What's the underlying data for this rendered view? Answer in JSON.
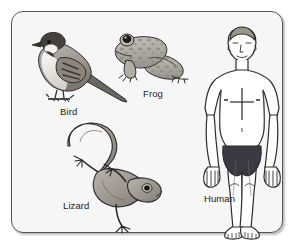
{
  "figure": {
    "background_color": "#ffffff",
    "panel_color": "#f6f6f6",
    "border_color": "#555555"
  },
  "specimens": [
    {
      "id": "bird",
      "label": "Bird",
      "description": "Side view of a perching sparrow facing left with long pointed tail",
      "colors": {
        "body": "#a8a39b",
        "head": "#4a4540",
        "cheek": "#f2f0ec",
        "wing": "#6e6962",
        "outline": "#2b2b2b"
      }
    },
    {
      "id": "frog",
      "label": "Frog",
      "description": "Side view of a sitting frog facing left with mottled spots and large dark eye",
      "colors": {
        "body": "#b6b1a8",
        "spots": "#8e8981",
        "eye": "#1d1d1d",
        "outline": "#2b2b2b"
      }
    },
    {
      "id": "lizard",
      "label": "Lizard",
      "description": "Lizard with S-curved tail sweeping up-left and head at lower right",
      "colors": {
        "body": "#a5a099",
        "shade": "#857f77",
        "eye": "#1d1d1d",
        "outline": "#2b2b2b"
      }
    },
    {
      "id": "human",
      "label": "Human",
      "description": "Front view line drawing of a standing man in dark swim briefs with a cross mark on the chest",
      "colors": {
        "skin": "#ffffff",
        "hair": "#9a958d",
        "briefs": "#3a3a42",
        "outline": "#2b2b2b"
      }
    }
  ]
}
